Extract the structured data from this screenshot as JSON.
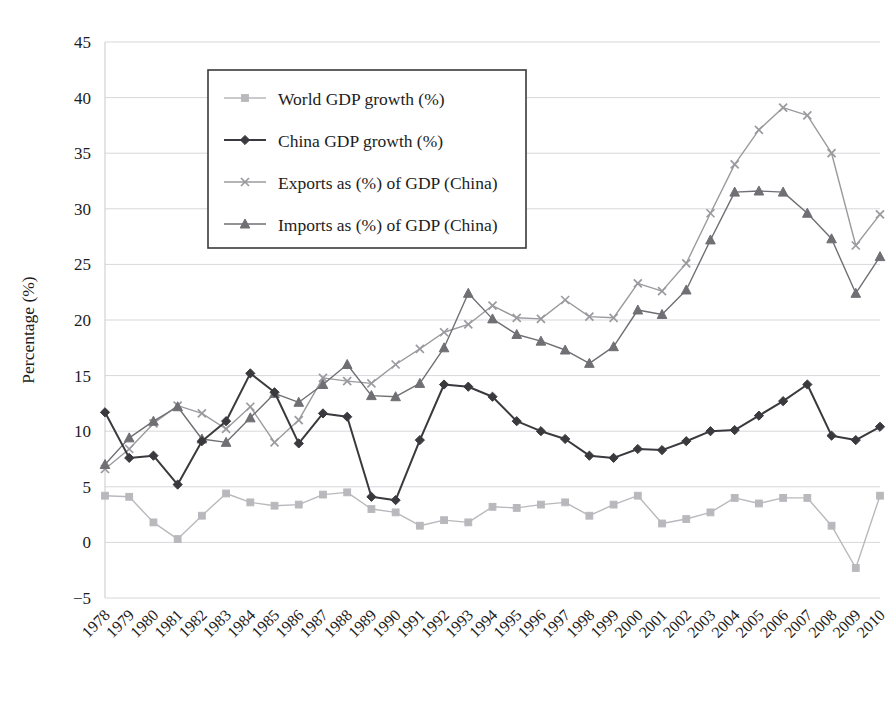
{
  "chart_data": {
    "type": "line",
    "title": "",
    "xlabel": "",
    "ylabel": "Percentage (%)",
    "ylim": [
      -5,
      45
    ],
    "ytick_step": 5,
    "yticks": [
      "45",
      "40",
      "35",
      "30",
      "25",
      "20",
      "15",
      "10",
      "5",
      "0",
      "−5"
    ],
    "grid": true,
    "legend_position": "upper-left-inside",
    "categories": [
      "1978",
      "1979",
      "1980",
      "1981",
      "1982",
      "1983",
      "1984",
      "1985",
      "1986",
      "1987",
      "1988",
      "1989",
      "1990",
      "1991",
      "1992",
      "1993",
      "1994",
      "1995",
      "1996",
      "1997",
      "1998",
      "1999",
      "2000",
      "2001",
      "2002",
      "2003",
      "2004",
      "2005",
      "2006",
      "2007",
      "2008",
      "2009",
      "2010"
    ],
    "series": [
      {
        "name": "World GDP growth (%)",
        "color": "#b9b9bd",
        "marker": "square",
        "values": [
          4.2,
          4.1,
          1.8,
          0.3,
          2.4,
          4.4,
          3.6,
          3.3,
          3.4,
          4.3,
          4.5,
          3.0,
          2.7,
          1.5,
          2.0,
          1.8,
          3.2,
          3.1,
          3.4,
          3.6,
          2.4,
          3.4,
          4.2,
          1.7,
          2.1,
          2.7,
          4.0,
          3.5,
          4.0,
          4.0,
          1.5,
          -2.3,
          4.2
        ]
      },
      {
        "name": "China GDP growth (%)",
        "color": "#3a3a3e",
        "marker": "diamond",
        "values": [
          11.7,
          7.6,
          7.8,
          5.2,
          9.1,
          10.9,
          15.2,
          13.5,
          8.9,
          11.6,
          11.3,
          4.1,
          3.8,
          9.2,
          14.2,
          14.0,
          13.1,
          10.9,
          10.0,
          9.3,
          7.8,
          7.6,
          8.4,
          8.3,
          9.1,
          10.0,
          10.1,
          11.4,
          12.7,
          14.2,
          9.6,
          9.2,
          10.4
        ]
      },
      {
        "name": "Exports as (%) of GDP (China)",
        "color": "#9b9b9f",
        "marker": "cross",
        "values": [
          6.6,
          8.4,
          10.7,
          12.3,
          11.6,
          10.2,
          12.2,
          9.0,
          11.0,
          14.8,
          14.5,
          14.3,
          16.0,
          17.4,
          18.9,
          19.6,
          21.3,
          20.2,
          20.1,
          21.8,
          20.3,
          20.2,
          23.3,
          22.6,
          25.1,
          29.6,
          34.0,
          37.1,
          39.1,
          38.4,
          35.0,
          26.7,
          29.5
        ]
      },
      {
        "name": "Imports as (%) of GDP (China)",
        "color": "#6f6f74",
        "marker": "triangle",
        "values": [
          7.0,
          9.4,
          10.9,
          12.2,
          9.3,
          9.0,
          11.2,
          13.4,
          12.6,
          14.2,
          16.0,
          13.2,
          13.1,
          14.3,
          17.5,
          22.4,
          20.1,
          18.7,
          18.1,
          17.3,
          16.1,
          17.6,
          20.9,
          20.5,
          22.7,
          27.2,
          31.5,
          31.6,
          31.5,
          29.6,
          27.3,
          22.4,
          25.7
        ]
      }
    ]
  }
}
